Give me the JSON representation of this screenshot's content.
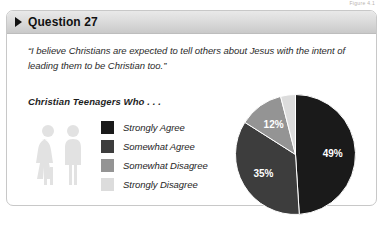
{
  "figure_caption": "Figure 4.1",
  "card": {
    "header": {
      "triangle_icon": "triangle-right-icon",
      "title": "Question 27"
    },
    "quote": {
      "line1": "“I believe Christians are expected to tell others about Jesus with the intent of",
      "line2": "leading them to be Christian too.”"
    },
    "subhead": "Christian Teenagers Who . . .",
    "people_icon": "two-people-icon"
  },
  "legend": {
    "items": [
      {
        "label": "Strongly Agree",
        "color": "#1a1a1a"
      },
      {
        "label": "Somewhat Agree",
        "color": "#3d3d3d"
      },
      {
        "label": "Somewhat Disagree",
        "color": "#949494"
      },
      {
        "label": "Strongly Disagree",
        "color": "#dcdcdc"
      }
    ]
  },
  "chart_data": {
    "type": "pie",
    "title": "Christian Teenagers Who . . .",
    "categories": [
      "Strongly Agree",
      "Somewhat Agree",
      "Somewhat Disagree",
      "Strongly Disagree"
    ],
    "values": [
      49,
      35,
      12,
      4
    ],
    "value_labels": [
      "49%",
      "35%",
      "12%",
      "4%"
    ],
    "colors": [
      "#1a1a1a",
      "#3d3d3d",
      "#949494",
      "#dcdcdc"
    ],
    "units": "percent",
    "start_angle_deg": 0,
    "direction": "clockwise",
    "legend_position": "left",
    "grid": false,
    "label_colors": [
      "white",
      "white",
      "white",
      "dark"
    ]
  }
}
